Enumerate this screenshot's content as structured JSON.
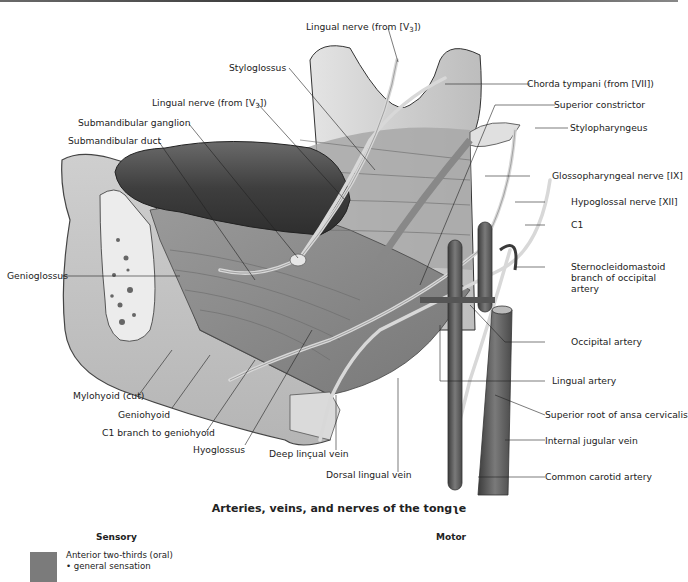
{
  "figure": {
    "title": "Arteries, veins, and nerves of the tongʅe",
    "colors": {
      "tongue": "#4a4a4a",
      "muscle": "#8c8c8c",
      "nerve": "#d6d6d6",
      "vessel": "#5a5a5a",
      "bone": "#e6e6e6",
      "legend_swatch": "#7b7b7b"
    }
  },
  "labels": {
    "lingual_nerve_top": "Lingual nerve (from [V",
    "lingual_nerve_top_sub": "3",
    "lingual_nerve_top_end": "])",
    "styloglossus": "Styloglossus",
    "lingual_nerve_mid": "Lingual nerve (from [V",
    "lingual_nerve_mid_sub": "3",
    "lingual_nerve_mid_end": "])",
    "submandibular_ganglion": "Submandibular ganglion",
    "submandibular_duct": "Submandibular duct",
    "genioglossus": "Genioglossus",
    "mylohyoid": "Mylohyoid (cut)",
    "geniohyoid": "Geniohyoid",
    "c1_branch": "C1 branch to geniohyoid",
    "hyoglossus": "Hyoglossus",
    "deep_lingual_vein": "Deep linçual vein",
    "dorsal_lingual_vein": "Dorsal lingual vein",
    "chorda_tympani": "Chorda tympani (from [VII])",
    "superior_constrictor": "Superior constrictor",
    "stylopharyngeus": "Stylopharyngeus",
    "glossopharyngeal": "Glossopharyngeal nerve [IX]",
    "hypoglossal": "Hypoglossal nerve [XII]",
    "c1": "C1",
    "scm_branch_1": "Sternocleidomastoid",
    "scm_branch_2": "branch of occipital",
    "scm_branch_3": "artery",
    "occipital_artery": "Occipital artery",
    "lingual_artery": "Lingual artery",
    "ansa_cervicalis": "Superior root of ansa cervicalis",
    "internal_jugular": "Internal jugular vein",
    "common_carotid": "Common carotid artery"
  },
  "legend": {
    "sensory_heading": "Sensory",
    "motor_heading": "Motor",
    "sensory_items": [
      "Anterior two-thirds (oral)",
      "• general sensation"
    ]
  }
}
